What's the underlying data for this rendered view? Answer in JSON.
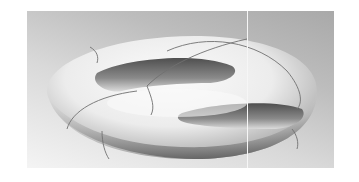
{
  "image": {
    "subject": "3D rendered genus-2 surface (double torus) with curves drawn on its surface",
    "colors": {
      "background_dark": "#a9a9a9",
      "background_light": "#f4f4f4",
      "surface_light": "#f2f2f2",
      "surface_shadow": "#6e6e6e",
      "curve_stroke": "#707070"
    }
  }
}
